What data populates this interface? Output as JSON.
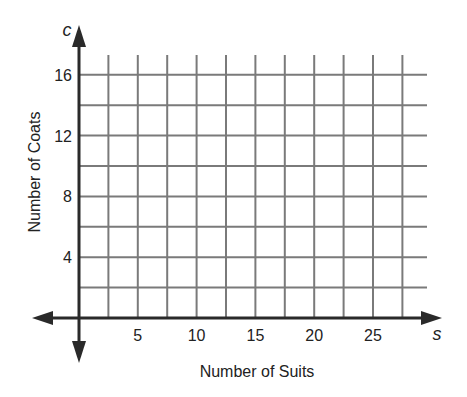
{
  "chart_data": {
    "type": "scatter",
    "title": "",
    "xlabel": "Number of Suits",
    "ylabel": "Number of Coats",
    "x_variable": "s",
    "y_variable": "c",
    "x_ticks": [
      "5",
      "10",
      "15",
      "20",
      "25"
    ],
    "y_ticks": [
      "4",
      "8",
      "12",
      "16"
    ],
    "xlim": [
      0,
      27.5
    ],
    "ylim": [
      0,
      16
    ],
    "x_grid_step": 2.5,
    "y_grid_step": 2,
    "grid": true,
    "series": [],
    "colors": {
      "grid": "#7a7a7a",
      "axis": "#2a2a2a",
      "text": "#222222"
    }
  }
}
